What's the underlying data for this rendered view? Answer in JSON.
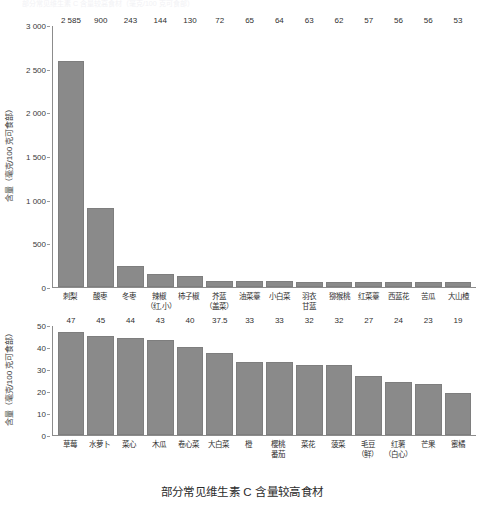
{
  "ghost_header_text": "部分常见维生素 C 含量较高食材（毫克/100 克可食部）",
  "caption": "部分常见维生素 C 含量较高食材",
  "colors": {
    "bar": "#8a8a8a",
    "axis": "#8c8c8c",
    "text": "#2f2f2f",
    "background": "#ffffff"
  },
  "chart_data": [
    {
      "type": "bar",
      "title": "",
      "xlabel": "",
      "ylabel": "含量（毫克/100 克可食部）",
      "ylim": [
        0,
        3000
      ],
      "yticks": [
        0,
        500,
        1000,
        1500,
        2000,
        2500,
        3000
      ],
      "ytick_labels": [
        "0",
        "500",
        "1 000",
        "1 500",
        "2 000",
        "2 500",
        "3 000"
      ],
      "grid": false,
      "legend": "none",
      "categories": [
        "刺梨",
        "酸枣",
        "冬枣",
        "辣椒\n（红,小）",
        "柿子椒",
        "芥蓝\n（盖菜）",
        "油菜薹",
        "小白菜",
        "羽衣\n甘蓝",
        "猕猴桃",
        "红菜薹",
        "西蓝花",
        "苦瓜",
        "大山楂"
      ],
      "values": [
        2585,
        900,
        243,
        144,
        130,
        72,
        65,
        64,
        63,
        62,
        57,
        56,
        56,
        53
      ],
      "value_labels": [
        "2 585",
        "900",
        "243",
        "144",
        "130",
        "72",
        "65",
        "64",
        "63",
        "62",
        "57",
        "56",
        "56",
        "53"
      ]
    },
    {
      "type": "bar",
      "title": "",
      "xlabel": "",
      "ylabel": "含量（毫克/100 克可食部）",
      "ylim": [
        0,
        50
      ],
      "yticks": [
        0,
        10,
        20,
        30,
        40,
        50
      ],
      "ytick_labels": [
        "0",
        "10",
        "20",
        "30",
        "40",
        "50"
      ],
      "grid": false,
      "legend": "none",
      "categories": [
        "草莓",
        "水萝卜",
        "菜心",
        "木瓜",
        "卷心菜",
        "大白菜",
        "橙",
        "樱桃\n番茄",
        "菜花",
        "菠菜",
        "毛豆\n（鲜）",
        "红薯\n（白心）",
        "芒果",
        "蜜橘"
      ],
      "values": [
        47,
        45,
        44,
        43,
        40,
        37.5,
        33,
        33,
        32,
        32,
        27,
        24,
        23,
        19
      ],
      "value_labels": [
        "47",
        "45",
        "44",
        "43",
        "40",
        "37.5",
        "33",
        "33",
        "32",
        "32",
        "27",
        "24",
        "23",
        "19"
      ]
    }
  ]
}
